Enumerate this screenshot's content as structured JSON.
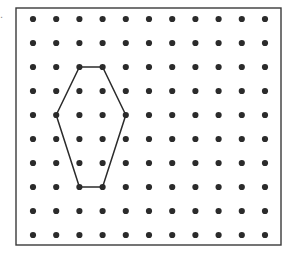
{
  "figure": {
    "kind": "geoboard-dot-grid-polygon",
    "label_fragment": ".",
    "background_color": "#ffffff",
    "ink_color": "#2b2b2b",
    "border": {
      "x": 16,
      "y": 8,
      "width": 265,
      "height": 237,
      "stroke_color": "#3a3a3a",
      "stroke_width": 1.4
    },
    "grid": {
      "columns": 11,
      "rows": 10,
      "origin_x": 33,
      "origin_y": 19,
      "spacing_x": 23.2,
      "spacing_y": 24.0,
      "dot_radius": 3.1,
      "dot_color": "#2b2b2b",
      "total_dots": 110
    },
    "polygon": {
      "name": "hexagon",
      "sides": 6,
      "closed": true,
      "stroke_color": "#2b2b2b",
      "stroke_width": 1.5,
      "fill": "none",
      "vertices_grid": [
        {
          "col": 2,
          "row": 2
        },
        {
          "col": 3,
          "row": 2
        },
        {
          "col": 4,
          "row": 4
        },
        {
          "col": 3,
          "row": 7
        },
        {
          "col": 2,
          "row": 7
        },
        {
          "col": 1,
          "row": 4
        }
      ],
      "vertices_px": [
        {
          "x": 79.4,
          "y": 67.0
        },
        {
          "x": 102.6,
          "y": 67.0
        },
        {
          "x": 125.8,
          "y": 115.0
        },
        {
          "x": 102.6,
          "y": 187.0
        },
        {
          "x": 79.4,
          "y": 187.0
        },
        {
          "x": 56.2,
          "y": 115.0
        }
      ]
    }
  },
  "chart_data": {
    "type": "scatter",
    "title": "",
    "xlabel": "",
    "ylabel": "",
    "xlim": [
      0,
      10
    ],
    "ylim": [
      0,
      9
    ],
    "grid": false,
    "legend": "none",
    "series": [
      {
        "name": "lattice-dots",
        "marker": "filled-circle",
        "color": "#2b2b2b",
        "x": [
          0,
          1,
          2,
          3,
          4,
          5,
          6,
          7,
          8,
          9,
          10,
          0,
          1,
          2,
          3,
          4,
          5,
          6,
          7,
          8,
          9,
          10,
          0,
          1,
          2,
          3,
          4,
          5,
          6,
          7,
          8,
          9,
          10,
          0,
          1,
          2,
          3,
          4,
          5,
          6,
          7,
          8,
          9,
          10,
          0,
          1,
          2,
          3,
          4,
          5,
          6,
          7,
          8,
          9,
          10,
          0,
          1,
          2,
          3,
          4,
          5,
          6,
          7,
          8,
          9,
          10,
          0,
          1,
          2,
          3,
          4,
          5,
          6,
          7,
          8,
          9,
          10,
          0,
          1,
          2,
          3,
          4,
          5,
          6,
          7,
          8,
          9,
          10,
          0,
          1,
          2,
          3,
          4,
          5,
          6,
          7,
          8,
          9,
          10,
          0,
          1,
          2,
          3,
          4,
          5,
          6,
          7,
          8,
          9,
          10
        ],
        "y": [
          9,
          9,
          9,
          9,
          9,
          9,
          9,
          9,
          9,
          9,
          9,
          8,
          8,
          8,
          8,
          8,
          8,
          8,
          8,
          8,
          8,
          8,
          7,
          7,
          7,
          7,
          7,
          7,
          7,
          7,
          7,
          7,
          7,
          6,
          6,
          6,
          6,
          6,
          6,
          6,
          6,
          6,
          6,
          6,
          5,
          5,
          5,
          5,
          5,
          5,
          5,
          5,
          5,
          5,
          5,
          4,
          4,
          4,
          4,
          4,
          4,
          4,
          4,
          4,
          4,
          4,
          3,
          3,
          3,
          3,
          3,
          3,
          3,
          3,
          3,
          3,
          3,
          2,
          2,
          2,
          2,
          2,
          2,
          2,
          2,
          2,
          2,
          2,
          1,
          1,
          1,
          1,
          1,
          1,
          1,
          1,
          1,
          1,
          1,
          0,
          0,
          0,
          0,
          0,
          0,
          0,
          0,
          0,
          0,
          0
        ]
      },
      {
        "name": "hexagon-outline",
        "marker": "none",
        "linestyle": "solid",
        "color": "#2b2b2b",
        "x": [
          2,
          3,
          4,
          3,
          2,
          1,
          2
        ],
        "y": [
          7,
          7,
          5,
          2,
          2,
          5,
          7
        ]
      }
    ]
  }
}
